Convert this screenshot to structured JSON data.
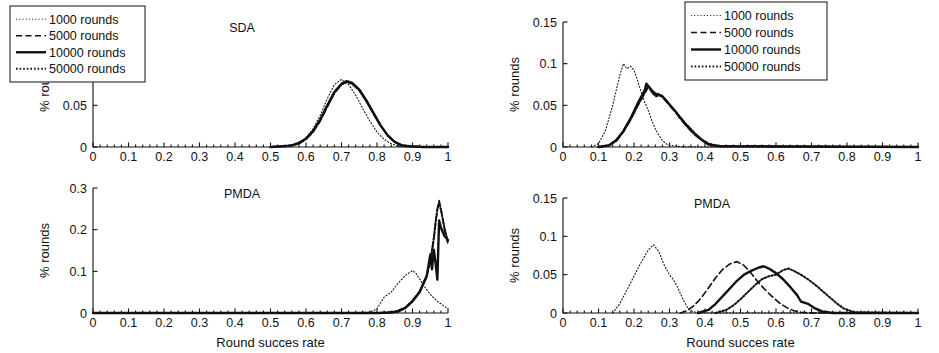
{
  "figure": {
    "width": 939,
    "height": 353,
    "background": "#ffffff",
    "ink_color": "#111111",
    "xlabel": "Round succes rate",
    "ylabel": "% rounds"
  },
  "legend": {
    "entries": [
      {
        "label": "1000 rounds",
        "style": "fine-dotted",
        "dash": "1,2.2",
        "width": 1.1
      },
      {
        "label": "5000 rounds",
        "style": "dashed",
        "dash": "6,3.5",
        "width": 1.6
      },
      {
        "label": "10000 rounds",
        "style": "solid",
        "dash": "none",
        "width": 2.4
      },
      {
        "label": "50000 rounds",
        "style": "thick-dotted",
        "dash": "1.6,2",
        "width": 2.0
      }
    ]
  },
  "chart_data": [
    {
      "id": "top-left",
      "type": "line",
      "title": "SDA",
      "xlabel": "",
      "ylabel": "% rounds",
      "xlim": [
        0,
        1
      ],
      "ylim": [
        0,
        0.15
      ],
      "xticks": [
        0,
        0.1,
        0.2,
        0.3,
        0.4,
        0.5,
        0.6,
        0.7,
        0.8,
        0.9,
        1
      ],
      "xticklabels": [
        "0",
        "0.1",
        "0.2",
        "0.3",
        "0.4",
        "0.5",
        "0.6",
        "0.7",
        "0.8",
        "0.9",
        "1"
      ],
      "yticks": [
        0,
        0.05,
        0.1,
        0.15
      ],
      "yticklabels": [
        "0",
        "0.05",
        "0.1",
        "0.15"
      ],
      "grid": false,
      "legend_position": "top-left-inside",
      "series": [
        {
          "name": "1000 rounds",
          "peak_x": 0.7,
          "peak_y": 0.081,
          "x": [
            0.5,
            0.54,
            0.56,
            0.58,
            0.6,
            0.62,
            0.64,
            0.66,
            0.68,
            0.7,
            0.72,
            0.74,
            0.76,
            0.78,
            0.8,
            0.82,
            0.84,
            0.86,
            0.88,
            0.9,
            0.94,
            1.0
          ],
          "y": [
            0.0,
            0.001,
            0.002,
            0.005,
            0.011,
            0.022,
            0.038,
            0.058,
            0.075,
            0.081,
            0.075,
            0.062,
            0.046,
            0.031,
            0.018,
            0.009,
            0.004,
            0.001,
            0.0,
            0.0,
            0.0,
            0.0
          ]
        },
        {
          "name": "5000 rounds",
          "peak_x": 0.715,
          "peak_y": 0.078,
          "x": [
            0.5,
            0.54,
            0.56,
            0.58,
            0.6,
            0.62,
            0.64,
            0.66,
            0.68,
            0.7,
            0.715,
            0.73,
            0.75,
            0.77,
            0.79,
            0.81,
            0.83,
            0.85,
            0.87,
            0.89,
            0.93,
            1.0
          ],
          "y": [
            0.0,
            0.001,
            0.002,
            0.004,
            0.009,
            0.018,
            0.031,
            0.048,
            0.065,
            0.075,
            0.078,
            0.076,
            0.068,
            0.055,
            0.04,
            0.026,
            0.014,
            0.006,
            0.002,
            0.001,
            0.0,
            0.0
          ]
        },
        {
          "name": "10000 rounds",
          "peak_x": 0.715,
          "peak_y": 0.079,
          "x": [
            0.5,
            0.54,
            0.56,
            0.58,
            0.6,
            0.62,
            0.64,
            0.66,
            0.68,
            0.7,
            0.715,
            0.73,
            0.75,
            0.77,
            0.79,
            0.81,
            0.83,
            0.85,
            0.87,
            0.89,
            0.93,
            1.0
          ],
          "y": [
            0.0,
            0.001,
            0.002,
            0.005,
            0.01,
            0.019,
            0.033,
            0.05,
            0.066,
            0.076,
            0.079,
            0.077,
            0.069,
            0.056,
            0.041,
            0.026,
            0.014,
            0.006,
            0.002,
            0.001,
            0.0,
            0.0
          ]
        },
        {
          "name": "50000 rounds",
          "peak_x": 0.715,
          "peak_y": 0.078,
          "x": [
            0.5,
            0.54,
            0.56,
            0.58,
            0.6,
            0.62,
            0.64,
            0.66,
            0.68,
            0.7,
            0.715,
            0.73,
            0.75,
            0.77,
            0.79,
            0.81,
            0.83,
            0.85,
            0.87,
            0.89,
            0.93,
            1.0
          ],
          "y": [
            0.0,
            0.001,
            0.002,
            0.004,
            0.01,
            0.019,
            0.032,
            0.049,
            0.065,
            0.075,
            0.078,
            0.076,
            0.068,
            0.055,
            0.04,
            0.026,
            0.014,
            0.006,
            0.002,
            0.001,
            0.0,
            0.0
          ]
        }
      ]
    },
    {
      "id": "top-right",
      "type": "line",
      "title": "SDA",
      "xlabel": "",
      "ylabel": "% rounds",
      "xlim": [
        0,
        1
      ],
      "ylim": [
        0,
        0.15
      ],
      "xticks": [
        0,
        0.1,
        0.2,
        0.3,
        0.4,
        0.5,
        0.6,
        0.7,
        0.8,
        0.9,
        1
      ],
      "xticklabels": [
        "0",
        "0.1",
        "0.2",
        "0.3",
        "0.4",
        "0.5",
        "0.6",
        "0.7",
        "0.8",
        "0.9",
        "1"
      ],
      "yticks": [
        0,
        0.05,
        0.1,
        0.15
      ],
      "yticklabels": [
        "0",
        "0.05",
        "0.1",
        "0.15"
      ],
      "grid": false,
      "legend_position": "top-right-outside",
      "series": [
        {
          "name": "1000 rounds",
          "peak_x": 0.17,
          "peak_y": 0.1,
          "x": [
            0.08,
            0.1,
            0.12,
            0.14,
            0.16,
            0.17,
            0.18,
            0.19,
            0.2,
            0.21,
            0.22,
            0.23,
            0.24,
            0.25,
            0.26,
            0.27,
            0.28,
            0.29,
            0.3,
            0.32,
            0.34,
            0.4,
            1.0
          ],
          "y": [
            0.0,
            0.004,
            0.02,
            0.05,
            0.086,
            0.1,
            0.094,
            0.097,
            0.092,
            0.08,
            0.066,
            0.054,
            0.044,
            0.032,
            0.022,
            0.014,
            0.008,
            0.004,
            0.002,
            0.001,
            0.0,
            0.0,
            0.0
          ]
        },
        {
          "name": "5000 rounds",
          "peak_x": 0.24,
          "peak_y": 0.072,
          "x": [
            0.1,
            0.13,
            0.15,
            0.17,
            0.19,
            0.21,
            0.23,
            0.24,
            0.25,
            0.26,
            0.27,
            0.28,
            0.29,
            0.3,
            0.31,
            0.32,
            0.33,
            0.35,
            0.37,
            0.39,
            0.41,
            0.44,
            1.0
          ],
          "y": [
            0.0,
            0.002,
            0.007,
            0.018,
            0.032,
            0.049,
            0.064,
            0.072,
            0.066,
            0.06,
            0.062,
            0.06,
            0.055,
            0.05,
            0.045,
            0.04,
            0.034,
            0.024,
            0.015,
            0.008,
            0.003,
            0.001,
            0.0
          ]
        },
        {
          "name": "10000 rounds",
          "peak_x": 0.235,
          "peak_y": 0.076,
          "x": [
            0.1,
            0.13,
            0.15,
            0.17,
            0.19,
            0.21,
            0.23,
            0.235,
            0.25,
            0.26,
            0.27,
            0.28,
            0.29,
            0.3,
            0.31,
            0.32,
            0.33,
            0.35,
            0.37,
            0.39,
            0.41,
            0.44,
            1.0
          ],
          "y": [
            0.0,
            0.002,
            0.008,
            0.019,
            0.034,
            0.052,
            0.068,
            0.076,
            0.068,
            0.064,
            0.063,
            0.061,
            0.056,
            0.051,
            0.046,
            0.041,
            0.035,
            0.025,
            0.016,
            0.009,
            0.003,
            0.001,
            0.0
          ]
        },
        {
          "name": "50000 rounds",
          "peak_x": 0.24,
          "peak_y": 0.073,
          "x": [
            0.1,
            0.13,
            0.15,
            0.17,
            0.19,
            0.21,
            0.23,
            0.24,
            0.25,
            0.26,
            0.27,
            0.28,
            0.29,
            0.3,
            0.31,
            0.32,
            0.33,
            0.35,
            0.37,
            0.39,
            0.41,
            0.44,
            1.0
          ],
          "y": [
            0.0,
            0.002,
            0.008,
            0.019,
            0.033,
            0.05,
            0.065,
            0.073,
            0.067,
            0.062,
            0.063,
            0.06,
            0.056,
            0.051,
            0.046,
            0.041,
            0.036,
            0.026,
            0.017,
            0.009,
            0.004,
            0.001,
            0.0
          ]
        }
      ]
    },
    {
      "id": "bottom-left",
      "type": "line",
      "title": "PMDA",
      "xlabel": "Round succes rate",
      "ylabel": "% rounds",
      "xlim": [
        0,
        1
      ],
      "ylim": [
        0,
        0.3
      ],
      "xticks": [
        0,
        0.1,
        0.2,
        0.3,
        0.4,
        0.5,
        0.6,
        0.7,
        0.8,
        0.9,
        1
      ],
      "xticklabels": [
        "0",
        "0.1",
        "0.2",
        "0.3",
        "0.4",
        "0.5",
        "0.6",
        "0.7",
        "0.8",
        "0.9",
        "1"
      ],
      "yticks": [
        0,
        0.1,
        0.2,
        0.3
      ],
      "yticklabels": [
        "0",
        "0.1",
        "0.2",
        "0.3"
      ],
      "grid": false,
      "legend_position": "none",
      "series": [
        {
          "name": "1000 rounds",
          "peak_x": 0.9,
          "peak_y": 0.102,
          "x": [
            0.0,
            0.7,
            0.78,
            0.8,
            0.82,
            0.84,
            0.86,
            0.88,
            0.9,
            0.91,
            0.92,
            0.93,
            0.94,
            0.95,
            0.96,
            0.97,
            0.98,
            0.99,
            1.0
          ],
          "y": [
            0.0,
            0.0,
            0.002,
            0.01,
            0.038,
            0.05,
            0.072,
            0.09,
            0.102,
            0.095,
            0.082,
            0.068,
            0.056,
            0.045,
            0.036,
            0.028,
            0.022,
            0.016,
            0.01
          ]
        },
        {
          "name": "5000 rounds",
          "peak_x": 0.975,
          "peak_y": 0.27,
          "x": [
            0.0,
            0.8,
            0.84,
            0.86,
            0.88,
            0.9,
            0.92,
            0.94,
            0.95,
            0.96,
            0.965,
            0.97,
            0.975,
            0.98,
            0.99,
            1.0
          ],
          "y": [
            0.0,
            0.0,
            0.002,
            0.006,
            0.014,
            0.03,
            0.052,
            0.09,
            0.12,
            0.175,
            0.215,
            0.25,
            0.27,
            0.25,
            0.2,
            0.165
          ]
        },
        {
          "name": "10000 rounds",
          "peak_x": 0.975,
          "peak_y": 0.222,
          "x": [
            0.0,
            0.8,
            0.84,
            0.86,
            0.88,
            0.9,
            0.92,
            0.94,
            0.95,
            0.955,
            0.96,
            0.965,
            0.97,
            0.975,
            0.98,
            0.99,
            1.0
          ],
          "y": [
            0.0,
            0.0,
            0.001,
            0.004,
            0.012,
            0.028,
            0.05,
            0.088,
            0.14,
            0.105,
            0.152,
            0.12,
            0.08,
            0.222,
            0.205,
            0.185,
            0.175
          ]
        },
        {
          "name": "50000 rounds",
          "peak_x": 0.975,
          "peak_y": 0.265,
          "x": [
            0.0,
            0.8,
            0.84,
            0.86,
            0.88,
            0.9,
            0.92,
            0.94,
            0.95,
            0.96,
            0.965,
            0.97,
            0.975,
            0.98,
            0.99,
            1.0
          ],
          "y": [
            0.0,
            0.0,
            0.002,
            0.005,
            0.013,
            0.029,
            0.051,
            0.089,
            0.125,
            0.18,
            0.218,
            0.248,
            0.265,
            0.248,
            0.205,
            0.17
          ]
        }
      ]
    },
    {
      "id": "bottom-right",
      "type": "line",
      "title": "PMDA",
      "xlabel": "Round succes rate",
      "ylabel": "% rounds",
      "xlim": [
        0,
        1
      ],
      "ylim": [
        0,
        0.15
      ],
      "xticks": [
        0,
        0.1,
        0.2,
        0.3,
        0.4,
        0.5,
        0.6,
        0.7,
        0.8,
        0.9,
        1
      ],
      "xticklabels": [
        "0",
        "0.1",
        "0.2",
        "0.3",
        "0.4",
        "0.5",
        "0.6",
        "0.7",
        "0.8",
        "0.9",
        "1"
      ],
      "yticks": [
        0,
        0.05,
        0.1,
        0.15
      ],
      "yticklabels": [
        "0",
        "0.05",
        "0.1",
        "0.15"
      ],
      "grid": false,
      "legend_position": "none",
      "series": [
        {
          "name": "1000 rounds",
          "peak_x": 0.255,
          "peak_y": 0.089,
          "x": [
            0.14,
            0.16,
            0.18,
            0.2,
            0.22,
            0.24,
            0.255,
            0.27,
            0.28,
            0.29,
            0.3,
            0.31,
            0.32,
            0.33,
            0.34,
            0.35,
            0.36,
            0.38,
            1.0
          ],
          "y": [
            0.0,
            0.012,
            0.03,
            0.048,
            0.066,
            0.082,
            0.089,
            0.08,
            0.068,
            0.058,
            0.05,
            0.044,
            0.036,
            0.026,
            0.016,
            0.008,
            0.003,
            0.0,
            0.0
          ]
        },
        {
          "name": "5000 rounds",
          "peak_x": 0.49,
          "peak_y": 0.067,
          "x": [
            0.33,
            0.35,
            0.37,
            0.39,
            0.41,
            0.43,
            0.45,
            0.47,
            0.49,
            0.51,
            0.53,
            0.55,
            0.57,
            0.59,
            0.61,
            0.63,
            0.65,
            0.67,
            0.7,
            1.0
          ],
          "y": [
            0.0,
            0.003,
            0.01,
            0.02,
            0.033,
            0.046,
            0.057,
            0.064,
            0.067,
            0.062,
            0.052,
            0.04,
            0.03,
            0.021,
            0.013,
            0.007,
            0.003,
            0.001,
            0.0,
            0.0
          ]
        },
        {
          "name": "10000 rounds",
          "peak_x": 0.565,
          "peak_y": 0.061,
          "x": [
            0.38,
            0.41,
            0.43,
            0.45,
            0.47,
            0.49,
            0.51,
            0.53,
            0.55,
            0.565,
            0.58,
            0.6,
            0.62,
            0.64,
            0.66,
            0.67,
            0.69,
            0.71,
            0.73,
            0.76,
            1.0
          ],
          "y": [
            0.0,
            0.004,
            0.012,
            0.022,
            0.032,
            0.042,
            0.05,
            0.055,
            0.059,
            0.061,
            0.058,
            0.052,
            0.044,
            0.034,
            0.023,
            0.015,
            0.012,
            0.006,
            0.002,
            0.0,
            0.0
          ]
        },
        {
          "name": "50000 rounds",
          "peak_x": 0.635,
          "peak_y": 0.058,
          "x": [
            0.43,
            0.46,
            0.48,
            0.5,
            0.52,
            0.54,
            0.56,
            0.58,
            0.6,
            0.62,
            0.635,
            0.65,
            0.67,
            0.69,
            0.71,
            0.73,
            0.75,
            0.77,
            0.79,
            0.82,
            1.0
          ],
          "y": [
            0.0,
            0.004,
            0.01,
            0.018,
            0.027,
            0.036,
            0.044,
            0.048,
            0.05,
            0.056,
            0.058,
            0.055,
            0.05,
            0.044,
            0.037,
            0.029,
            0.021,
            0.013,
            0.006,
            0.001,
            0.0
          ]
        }
      ]
    }
  ]
}
